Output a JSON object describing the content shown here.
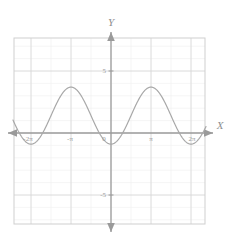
{
  "chart_data": {
    "type": "line",
    "title": "",
    "xlabel": "X",
    "ylabel": "Y",
    "xlim": [
      -7.6,
      7.6
    ],
    "ylim": [
      -7.1,
      7.1
    ],
    "grid": true,
    "legend": null,
    "x_tick_labels": [
      "-2π",
      "-π",
      "π",
      "2π"
    ],
    "x_tick_values": [
      -6.2832,
      -3.1416,
      3.1416,
      6.2832
    ],
    "y_tick_labels": [
      "5",
      "-5"
    ],
    "y_tick_values": [
      5,
      -5
    ],
    "origin_label": "0",
    "series": [
      {
        "name": "y = 3 - 3cos(x)... cosine wave",
        "equation": "y = 1.4 - 2.3*cos(x)",
        "amplitude": 2.3,
        "vertical_shift": 1.4,
        "period": 6.2832,
        "maxima_x": [
          -3.1416,
          3.1416
        ],
        "maxima_y": 3.7,
        "minima_x": [
          -6.2832,
          0,
          6.2832
        ],
        "minima_y": -0.9,
        "color": "#a8a8a8"
      }
    ],
    "axis_color": "#9a9a9a",
    "grid_color": "#d8d8d8",
    "minor_grid_color": "#eeeeee",
    "frame_color": "#cfcfcf",
    "background": "#ffffff"
  },
  "labels": {
    "y_axis_name": "Y",
    "x_axis_name": "X",
    "y_five": "5",
    "y_minus_five": "-5",
    "origin": "0",
    "x_minus_two_pi": "-2π",
    "x_minus_pi": "-π",
    "x_pi": "π",
    "x_two_pi": "2π"
  }
}
